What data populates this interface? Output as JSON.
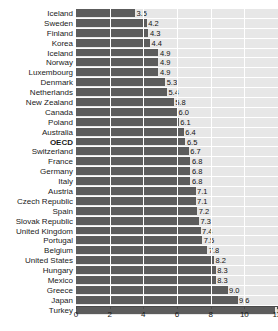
{
  "chart_data": {
    "type": "bar",
    "orientation": "horizontal",
    "title": "",
    "xlabel": "",
    "ylabel": "",
    "xlim": [
      0,
      12
    ],
    "xticks": [
      0,
      2,
      4,
      6,
      8,
      10,
      12
    ],
    "grid": true,
    "legend": null,
    "value_labels": true,
    "highlight_category": "OECD",
    "colors": {
      "bar": "#5c5c5c",
      "plot_background": "#e7e7e7",
      "gridline": "#ffffff",
      "axis": "#4a4a4a",
      "text": "#1a1a1a",
      "page_background": "#ffffff"
    },
    "categories": [
      "Iceland",
      "Sweden",
      "Finland",
      "Korea",
      "Iceland",
      "Norway",
      "Luxembourg",
      "Denmark",
      "Netherlands",
      "New Zealand",
      "Canada",
      "Poland",
      "Australia",
      "OECD",
      "Switzerland",
      "France",
      "Germany",
      "Italy",
      "Austria",
      "Czech Republic",
      "Spain",
      "Slovak Republic",
      "United Kingdom",
      "Portugal",
      "Belgium",
      "United States",
      "Hungary",
      "Mexico",
      "Greece",
      "Japan",
      "Turkey"
    ],
    "values": [
      3.5,
      4.2,
      4.3,
      4.4,
      4.9,
      4.9,
      4.9,
      5.3,
      5.4,
      5.8,
      6.0,
      6.1,
      6.4,
      6.5,
      6.7,
      6.8,
      6.8,
      6.8,
      7.1,
      7.1,
      7.2,
      7.3,
      7.4,
      7.5,
      7.8,
      8.2,
      8.3,
      8.3,
      9.0,
      9.6,
      11.8
    ],
    "value_label_text": [
      "3.5",
      "4.2",
      "4.3",
      "4.4",
      "4.9",
      "4.9",
      "4.9",
      "5.3",
      "5.4",
      "5.8",
      "6.0",
      "6.1",
      "6.4",
      "6.5",
      "6.7",
      "6.8",
      "6.8",
      "6.8",
      "7.1",
      "7.1",
      "7.2",
      "7.3",
      "7.4",
      "7.5",
      "7.8",
      "8.2",
      "8.3",
      "8.3",
      "9.0",
      "9.6",
      "11.8"
    ]
  }
}
